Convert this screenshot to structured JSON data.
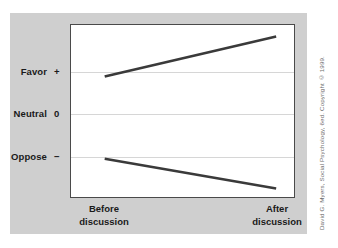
{
  "figure": {
    "credit": "David G. Myers, Social Psychology, 6ed. Copyright © 1999.",
    "panel_color": "#cfcfcf",
    "plot_background": "#ffffff",
    "plot_border_color": "#4a4a4a",
    "gridline_color": "#d6d6d6",
    "line_color": "#3a3a3a"
  },
  "chart_data": {
    "type": "line",
    "title": "",
    "subtitle": "",
    "xlabel": "",
    "ylabel": "",
    "grid": true,
    "legend": "none",
    "categories": [
      "Before discussion",
      "After discussion"
    ],
    "x": [
      "Before discussion",
      "After discussion"
    ],
    "y_tick_labels": [
      "Favor",
      "Neutral",
      "Oppose"
    ],
    "y_tick_symbols": [
      "+",
      "0",
      "−"
    ],
    "y_tick_values": [
      1,
      0,
      -1
    ],
    "ylim": [
      -1.8,
      1.8
    ],
    "annotations": [],
    "series": [
      {
        "name": "Initially favorable group",
        "values": [
          0.72,
          1.56
        ]
      },
      {
        "name": "Initially opposed group",
        "values": [
          -1.0,
          -1.62
        ]
      }
    ]
  },
  "axes": {
    "y_labels": [
      {
        "name": "Favor",
        "symbol": "+"
      },
      {
        "name": "Neutral",
        "symbol": "0"
      },
      {
        "name": "Oppose",
        "symbol": "−"
      }
    ],
    "x_labels": [
      {
        "line1": "Before",
        "line2": "discussion"
      },
      {
        "line1": "After",
        "line2": "discussion"
      }
    ]
  }
}
